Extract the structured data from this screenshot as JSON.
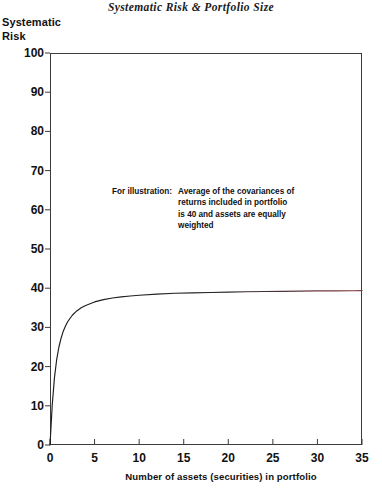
{
  "chart_data": {
    "type": "line",
    "title": "Systematic Risk & Portfolio Size",
    "ylabel_line1": "Systematic",
    "ylabel_line2": "Risk",
    "xlabel": "Number of assets (securities) in portfolio",
    "xlim": [
      0,
      35
    ],
    "ylim": [
      0,
      100
    ],
    "xticks": [
      0,
      5,
      10,
      15,
      20,
      25,
      30,
      35
    ],
    "yticks": [
      0,
      10,
      20,
      30,
      40,
      50,
      60,
      70,
      80,
      90,
      100
    ],
    "grid": false,
    "legend": false,
    "asymptote": 40,
    "line_color_left": "#1c1c1c",
    "line_color_right": "#7a3a3f",
    "annotation_lead": "For illustration:",
    "annotation_lines": [
      "Average of the covariances of",
      "returns included in portfolio",
      "is 40 and assets are equally",
      "weighted"
    ],
    "x": [
      0,
      0.25,
      0.5,
      0.75,
      1,
      1.25,
      1.5,
      1.75,
      2,
      2.5,
      3,
      3.5,
      4,
      5,
      6,
      7,
      8,
      9,
      10,
      12,
      14,
      16,
      18,
      20,
      22,
      24,
      26,
      28,
      30,
      32,
      34,
      35
    ],
    "values": [
      0,
      10.2,
      17.2,
      21.8,
      25.0,
      27.3,
      29.1,
      30.4,
      31.5,
      33.1,
      34.2,
      35.0,
      35.6,
      36.5,
      37.1,
      37.5,
      37.8,
      38.0,
      38.2,
      38.5,
      38.7,
      38.8,
      38.9,
      39.0,
      39.1,
      39.15,
      39.2,
      39.25,
      39.3,
      39.33,
      39.36,
      39.38
    ]
  }
}
